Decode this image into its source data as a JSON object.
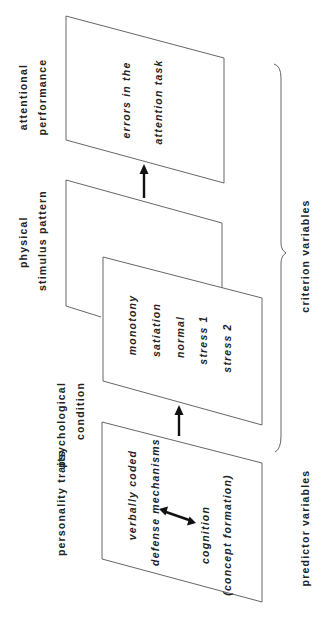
{
  "diagram": {
    "orientation": "rotated 90 degrees counter-clockwise",
    "columns": [
      {
        "id": "personality",
        "label_lines": [
          "personality traits"
        ],
        "items": [
          "verbally coded",
          "defense mechanisms",
          "cognition",
          "(concept formation)"
        ],
        "relation": "double-arrow between defense mechanisms and cognition"
      },
      {
        "id": "psychological",
        "label_lines": [
          "psychological",
          "condition"
        ],
        "items": [
          "monotony",
          "satiation",
          "normal",
          "stress 1",
          "stress 2"
        ]
      },
      {
        "id": "physical",
        "label_lines": [
          "physical",
          "stimulus pattern"
        ],
        "items": []
      },
      {
        "id": "attentional",
        "label_lines": [
          "attentional",
          "performance"
        ],
        "items": [
          "errors in the",
          "attention task"
        ]
      }
    ],
    "group_labels": {
      "predictor": "predictor variables",
      "criterion": "criterion variables"
    },
    "colors": {
      "line": "#555555",
      "arrow": "#111111",
      "text": "#222222",
      "background": "#ffffff"
    }
  }
}
